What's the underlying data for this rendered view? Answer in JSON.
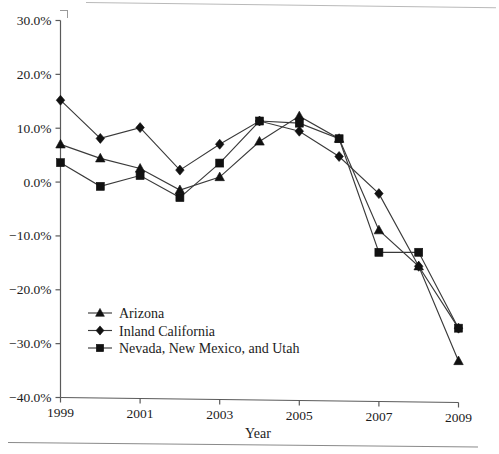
{
  "chart_data": {
    "type": "line",
    "title": "",
    "xlabel": "Year",
    "ylabel": "",
    "x": [
      1999,
      2000,
      2001,
      2002,
      2003,
      2004,
      2005,
      2006,
      2007,
      2008,
      2009
    ],
    "categories": [
      "1999",
      "2000",
      "2001",
      "2002",
      "2003",
      "2004",
      "2005",
      "2006",
      "2007",
      "2008",
      "2009"
    ],
    "xlim": [
      1999,
      2009
    ],
    "ylim": [
      -40,
      30
    ],
    "xticks": [
      1999,
      2001,
      2003,
      2005,
      2007,
      2009
    ],
    "xticklabels": [
      "1999",
      "2001",
      "2003",
      "2005",
      "2007",
      "2009"
    ],
    "yticks": [
      30,
      20,
      10,
      0,
      -10,
      -20,
      -30,
      -40
    ],
    "yticklabels": [
      "30.0%",
      "20.0%",
      "10.0%",
      "0.0%",
      "−10.0%",
      "−20.0%",
      "−30.0%",
      "−40.0%"
    ],
    "grid": false,
    "legend_position": "lower left",
    "series": [
      {
        "name": "Arizona",
        "marker": "triangle",
        "values": [
          7.0,
          4.5,
          2.7,
          -1.2,
          1.3,
          8.0,
          12.8,
          8.7,
          -8.2,
          -14.8,
          -32.3
        ]
      },
      {
        "name": "Inland California",
        "marker": "diamond",
        "values": [
          15.2,
          8.2,
          10.3,
          2.5,
          7.4,
          11.8,
          10.0,
          5.4,
          -1.4,
          -14.8,
          -26.2
        ]
      },
      {
        "name": "Nevada, New Mexico, and Utah",
        "marker": "square",
        "values": [
          3.6,
          -0.7,
          1.4,
          -2.6,
          3.9,
          11.8,
          11.5,
          8.7,
          -12.3,
          -12.2,
          -26.2
        ]
      }
    ]
  },
  "legend": {
    "entries": [
      {
        "label": "Arizona",
        "marker": "triangle"
      },
      {
        "label": "Inland California",
        "marker": "diamond"
      },
      {
        "label": "Nevada, New Mexico, and Utah",
        "marker": "square"
      }
    ]
  },
  "axes": {
    "x_title": "Year"
  }
}
